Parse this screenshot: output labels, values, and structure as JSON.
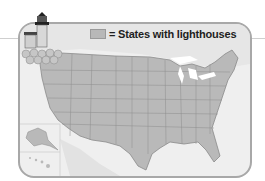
{
  "legend": {
    "label": "= States with lighthouses",
    "swatch_color": "#b8b8b8"
  },
  "map": {
    "region": "United States (contiguous 48 states with Alaska and Hawaii insets)",
    "state_fill": "#b9b9b9",
    "state_border": "#7d7d7d",
    "background": "#efefef",
    "water_lakes": "#ffffff",
    "insets": [
      "Alaska",
      "Hawaii"
    ]
  },
  "decoration": {
    "icon": "lighthouse-icon"
  }
}
